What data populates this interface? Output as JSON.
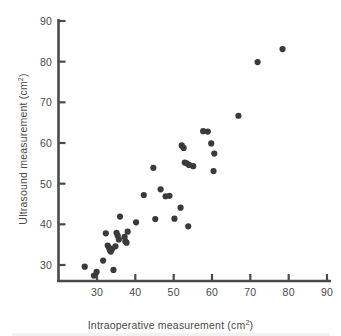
{
  "figure": {
    "background_color": "#ffffff",
    "axis_color": "#4a4a4a",
    "marker_color": "#3a3a3a",
    "text_color": "#4a4a4a"
  },
  "chart_data": {
    "type": "scatter",
    "title": "",
    "xlabel": "Intraoperative measurement (cm²)",
    "ylabel": "Ultrasound measurement (cm²)",
    "xlim": [
      23,
      93
    ],
    "ylim": [
      23,
      90
    ],
    "xticks": [
      30,
      40,
      50,
      60,
      70,
      80,
      90
    ],
    "yticks": [
      30,
      40,
      50,
      60,
      70,
      80,
      90
    ],
    "xtick_labels": [
      "30",
      "40",
      "50",
      "60",
      "70",
      "80",
      "90"
    ],
    "ytick_labels": [
      "30",
      "40",
      "50",
      "60",
      "70",
      "80",
      "90"
    ],
    "grid": false,
    "legend": null,
    "marker_shape": "circle",
    "marker_size_px": 4.2,
    "n_points": 44,
    "points": [
      {
        "x": 26.8,
        "y": 29.6
      },
      {
        "x": 29.2,
        "y": 27.4
      },
      {
        "x": 29.9,
        "y": 28.3
      },
      {
        "x": 31.6,
        "y": 31.1
      },
      {
        "x": 32.3,
        "y": 37.8
      },
      {
        "x": 32.8,
        "y": 34.8
      },
      {
        "x": 33.1,
        "y": 34.3
      },
      {
        "x": 33.4,
        "y": 33.6
      },
      {
        "x": 33.6,
        "y": 33.3
      },
      {
        "x": 34.3,
        "y": 28.8
      },
      {
        "x": 34.8,
        "y": 34.6
      },
      {
        "x": 35.1,
        "y": 37.9
      },
      {
        "x": 35.4,
        "y": 37.2
      },
      {
        "x": 36.0,
        "y": 41.9
      },
      {
        "x": 37.2,
        "y": 36.9
      },
      {
        "x": 37.4,
        "y": 35.8
      },
      {
        "x": 37.7,
        "y": 35.5
      },
      {
        "x": 38.0,
        "y": 38.2
      },
      {
        "x": 40.2,
        "y": 40.5
      },
      {
        "x": 42.2,
        "y": 47.2
      },
      {
        "x": 44.7,
        "y": 53.9
      },
      {
        "x": 45.2,
        "y": 41.3
      },
      {
        "x": 46.6,
        "y": 48.6
      },
      {
        "x": 47.9,
        "y": 46.9
      },
      {
        "x": 50.2,
        "y": 41.4
      },
      {
        "x": 51.8,
        "y": 44.1
      },
      {
        "x": 52.1,
        "y": 59.4
      },
      {
        "x": 52.6,
        "y": 58.8
      },
      {
        "x": 52.9,
        "y": 55.2
      },
      {
        "x": 53.4,
        "y": 55.0
      },
      {
        "x": 53.8,
        "y": 39.5
      },
      {
        "x": 55.1,
        "y": 54.3
      },
      {
        "x": 57.7,
        "y": 62.9
      },
      {
        "x": 58.9,
        "y": 62.8
      },
      {
        "x": 59.8,
        "y": 59.9
      },
      {
        "x": 60.6,
        "y": 57.4
      },
      {
        "x": 60.4,
        "y": 53.1
      },
      {
        "x": 66.9,
        "y": 66.7
      },
      {
        "x": 71.9,
        "y": 79.9
      },
      {
        "x": 78.4,
        "y": 83.1
      },
      {
        "x": 33.9,
        "y": 33.9
      },
      {
        "x": 35.7,
        "y": 36.3
      },
      {
        "x": 48.9,
        "y": 47.0
      },
      {
        "x": 54.0,
        "y": 54.6
      }
    ]
  }
}
